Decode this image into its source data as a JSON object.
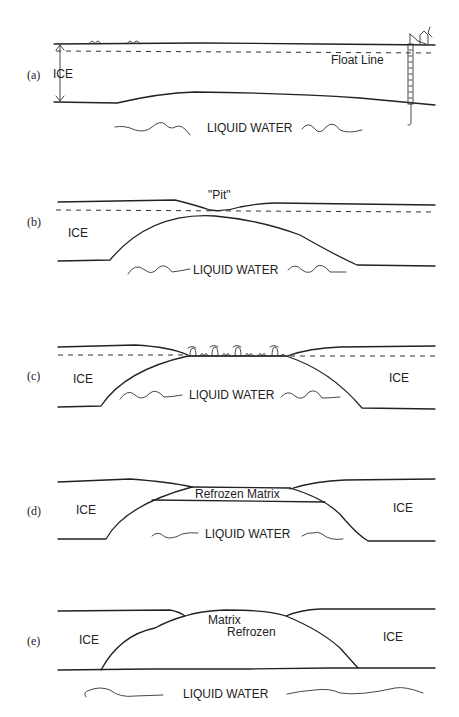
{
  "panels": [
    {
      "id": "a",
      "tag": "(a)",
      "labels": {
        "ice": "ICE",
        "float_line": "Float Line",
        "water": "LIQUID WATER"
      }
    },
    {
      "id": "b",
      "tag": "(b)",
      "labels": {
        "pit": "\"Pit\"",
        "ice": "ICE",
        "water": "LIQUID WATER"
      }
    },
    {
      "id": "c",
      "tag": "(c)",
      "labels": {
        "ice_left": "ICE",
        "ice_right": "ICE",
        "water": "LIQUID WATER"
      }
    },
    {
      "id": "d",
      "tag": "(d)",
      "labels": {
        "ice_left": "ICE",
        "ice_right": "ICE",
        "matrix": "Refrozen Matrix",
        "water": "LIQUID WATER"
      }
    },
    {
      "id": "e",
      "tag": "(e)",
      "labels": {
        "ice_left": "ICE",
        "ice_right": "ICE",
        "matrix_line1": "Matrix",
        "matrix_line2": "Refrozen",
        "water": "LIQUID WATER"
      }
    }
  ]
}
